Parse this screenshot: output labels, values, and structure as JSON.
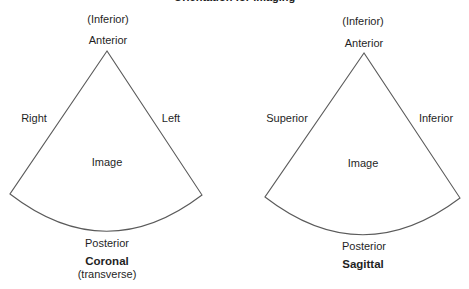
{
  "title": "Orientation for imaging",
  "colors": {
    "line": "#5a5a5a",
    "text": "#1f1f1f",
    "background": "#ffffff"
  },
  "diagrams": [
    {
      "id": "coronal",
      "top_note": "(Inferior)",
      "apex_label": "Anterior",
      "left_label": "Right",
      "right_label": "Left",
      "center_label": "Image",
      "bottom_label": "Posterior",
      "plane_name": "Coronal",
      "plane_subtitle": "(transverse)",
      "geometry": {
        "apex": [
          107,
          51
        ],
        "left_corner": [
          10,
          194
        ],
        "right_corner": [
          202,
          195
        ],
        "arc_bottom_y": 231
      }
    },
    {
      "id": "sagittal",
      "top_note": "(Inferior)",
      "apex_label": "Anterior",
      "left_label": "Superior",
      "right_label": "Inferior",
      "center_label": "Image",
      "bottom_label": "Posterior",
      "plane_name": "Sagittal",
      "plane_subtitle": "",
      "geometry": {
        "apex": [
          364,
          53
        ],
        "left_corner": [
          265,
          197
        ],
        "right_corner": [
          460,
          198
        ],
        "arc_bottom_y": 235
      }
    }
  ]
}
